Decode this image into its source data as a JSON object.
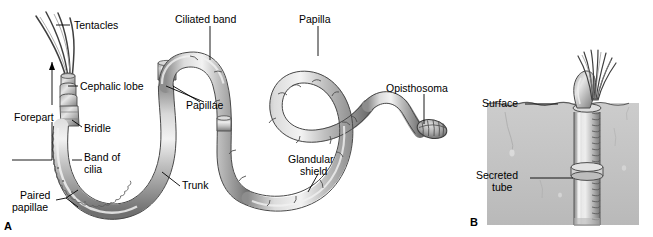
{
  "figure": {
    "background_color": "#ffffff",
    "line_color": "#000000",
    "body_light": "#e9e9e9",
    "body_mid": "#b6b6b6",
    "body_dark": "#6f6f6f",
    "body_outline": "#3c3c3c",
    "sediment_color": "#c9c9c9",
    "sediment_dark": "#a8a8a8",
    "width": 653,
    "height": 237
  },
  "panels": [
    {
      "id": "A",
      "letter": "A",
      "caption": "Whole body of pogonophoran worm removed from tube"
    },
    {
      "id": "B",
      "letter": "B",
      "caption": "Worm in secreted tube projecting above sediment surface"
    }
  ],
  "panel_a": {
    "letter": "A",
    "labels": [
      {
        "id": "tentacles",
        "text": "Tentacles",
        "x": 74,
        "y": 20,
        "align": "left"
      },
      {
        "id": "cephalic-lobe",
        "text": "Cephalic lobe",
        "x": 80,
        "y": 81,
        "align": "left"
      },
      {
        "id": "forepart",
        "text": "Forepart",
        "x": 14,
        "y": 112,
        "align": "left"
      },
      {
        "id": "bridle",
        "text": "Bridle",
        "x": 84,
        "y": 123,
        "align": "left"
      },
      {
        "id": "band-of-cilia",
        "text": "Band of",
        "x": 84,
        "y": 156,
        "align": "left"
      },
      {
        "id": "band-of-cilia-2",
        "text": "cilia",
        "x": 84,
        "y": 168,
        "align": "left"
      },
      {
        "id": "paired-papillae",
        "text": "Paired",
        "x": 20,
        "y": 193,
        "align": "left"
      },
      {
        "id": "paired-papillae-2",
        "text": "papillae",
        "x": 14,
        "y": 205,
        "align": "left"
      },
      {
        "id": "trunk",
        "text": "Trunk",
        "x": 182,
        "y": 182,
        "align": "left"
      },
      {
        "id": "ciliated-band",
        "text": "Ciliated band",
        "x": 176,
        "y": 16,
        "align": "left"
      },
      {
        "id": "papillae",
        "text": "Papillae",
        "x": 186,
        "y": 103,
        "align": "left"
      },
      {
        "id": "papilla",
        "text": "Papilla",
        "x": 299,
        "y": 16,
        "align": "left"
      },
      {
        "id": "glandular-shield",
        "text": "Glandular",
        "x": 290,
        "y": 157,
        "align": "left"
      },
      {
        "id": "glandular-shield-2",
        "text": "shield",
        "x": 299,
        "y": 169,
        "align": "left"
      },
      {
        "id": "opisthosoma",
        "text": "Opisthosoma",
        "x": 387,
        "y": 85,
        "align": "left"
      }
    ],
    "anatomy_parts": [
      "tentacles",
      "cephalic lobe",
      "bridle",
      "forepart",
      "band of cilia",
      "paired papillae",
      "trunk",
      "ciliated band",
      "papillae",
      "papilla",
      "glandular shield",
      "opisthosoma"
    ]
  },
  "panel_b": {
    "letter": "B",
    "labels": [
      {
        "id": "surface",
        "text": "Surface",
        "x": 483,
        "y": 100,
        "align": "left"
      },
      {
        "id": "secreted-tube",
        "text": "Secreted",
        "x": 478,
        "y": 173,
        "align": "left"
      },
      {
        "id": "secreted-tube-2",
        "text": "tube",
        "x": 492,
        "y": 185,
        "align": "left"
      }
    ],
    "anatomy_parts": [
      "surface",
      "secreted tube",
      "tentacle plume",
      "cephalic lobe"
    ]
  }
}
